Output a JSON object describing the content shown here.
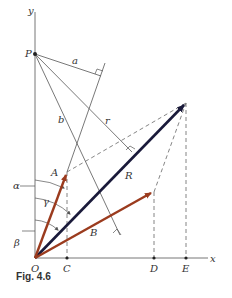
{
  "figure": {
    "caption": "Fig. 4.6",
    "colors": {
      "line": "#555555",
      "resultant": "#1a1a3a",
      "component": "#9b3b1e"
    },
    "labels": {
      "y_axis": "y",
      "x_axis": "x",
      "P": "P",
      "O": "O",
      "C": "C",
      "D": "D",
      "E": "E",
      "a": "a",
      "b": "b",
      "r": "r",
      "A": "A",
      "B": "B",
      "R": "R",
      "alpha": "α",
      "beta": "β",
      "gamma": "γ"
    }
  }
}
